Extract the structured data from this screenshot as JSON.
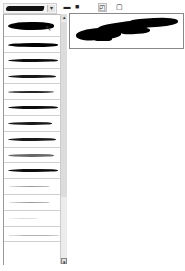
{
  "panel": {
    "title": "Brush Presets",
    "preset_dropdown": {
      "icon": "chevron-down-icon",
      "glyph": "▾"
    }
  },
  "toolbar": {
    "buttons": [
      {
        "name": "open-folder-icon",
        "glyph": "▬",
        "x": 3
      },
      {
        "name": "save-icon",
        "glyph": "■",
        "x": 13
      },
      {
        "name": "new-preset-icon",
        "glyph": "◰",
        "x": 38,
        "boxed": true
      },
      {
        "name": "delete-icon",
        "glyph": "▢",
        "x": 55
      }
    ]
  },
  "brush_list": {
    "items": [
      {
        "label": "Brush 1",
        "width": 46,
        "height": 8,
        "top": 7,
        "opacity": 1.0,
        "selected": true
      },
      {
        "label": "Brush 2",
        "width": 50,
        "height": 4,
        "top": 6,
        "opacity": 1.0
      },
      {
        "label": "Brush 3",
        "width": 50,
        "height": 3,
        "top": 6,
        "opacity": 0.95
      },
      {
        "label": "Brush 4",
        "width": 48,
        "height": 3,
        "top": 6,
        "opacity": 0.9
      },
      {
        "label": "Brush 5",
        "width": 46,
        "height": 2,
        "top": 7,
        "opacity": 0.85
      },
      {
        "label": "Brush 6",
        "width": 50,
        "height": 3,
        "top": 6,
        "opacity": 0.95
      },
      {
        "label": "Brush 7",
        "width": 44,
        "height": 3,
        "top": 6,
        "opacity": 0.9
      },
      {
        "label": "Brush 8",
        "width": 48,
        "height": 3,
        "top": 6,
        "opacity": 0.9
      },
      {
        "label": "Brush 9",
        "width": 46,
        "height": 3,
        "top": 6,
        "opacity": 0.6
      },
      {
        "label": "Brush 10",
        "width": 50,
        "height": 3,
        "top": 6,
        "opacity": 0.95
      },
      {
        "label": "Brush 11",
        "width": 42,
        "height": 1,
        "top": 7,
        "opacity": 0.4
      },
      {
        "label": "Brush 12",
        "width": 42,
        "height": 1,
        "top": 7,
        "opacity": 0.4
      },
      {
        "label": "Brush 13",
        "width": 30,
        "height": 1,
        "top": 7,
        "opacity": 0.15
      },
      {
        "label": "Brush 14",
        "width": 52,
        "height": 1,
        "top": 8,
        "opacity": 0.3
      }
    ]
  },
  "scrollbar": {
    "up_glyph": "▴",
    "down_glyph": "▾"
  },
  "preview": {
    "label": "Stroke Preview"
  },
  "colors": {
    "stroke": "#000000",
    "border": "#888888",
    "background": "#ffffff"
  }
}
